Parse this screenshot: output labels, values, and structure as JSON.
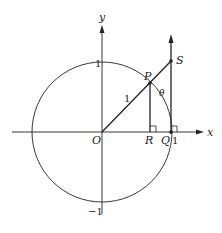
{
  "diagram": {
    "labels": {
      "y_axis": "y",
      "x_axis": "x",
      "origin": "O",
      "point_P": "P",
      "point_R": "R",
      "point_Q": "Q",
      "point_S": "S",
      "theta": "θ",
      "radius": "1",
      "y_one": "1",
      "y_neg_one": "−1",
      "x_one": "1"
    },
    "colors": {
      "stroke": "#222222",
      "background": "#ffffff"
    }
  }
}
